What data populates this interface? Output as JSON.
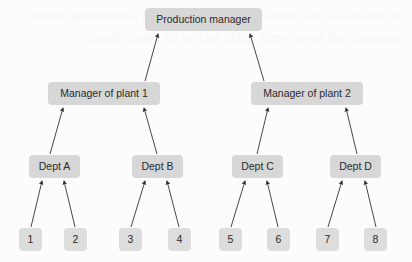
{
  "diagram": {
    "type": "organizational-hierarchy",
    "background_color": "#fcfcfc",
    "node_fill_color": "#d7d7d7",
    "leaf_fill_color": "#dddddd",
    "edge_color": "#333333",
    "text_color": "#2b2b2b",
    "edge_direction": "upward",
    "levels": 4,
    "bleed_text": "the structure of the organization and the reporting relationships among managers and departments within each of the plants shown"
  },
  "nodes": {
    "root": {
      "id": "production-manager",
      "label": "Production manager",
      "level": 1,
      "x": 145,
      "y": 8,
      "width": 117,
      "height": 23
    },
    "managers": [
      {
        "id": "manager-of-plant-1",
        "label": "Manager of plant 1",
        "level": 2,
        "x": 48,
        "y": 82,
        "width": 112,
        "height": 23
      },
      {
        "id": "manager-of-plant-2",
        "label": "Manager of plant 2",
        "level": 2,
        "x": 251,
        "y": 82,
        "width": 112,
        "height": 23
      }
    ],
    "departments": [
      {
        "id": "dept-a",
        "label": "Dept A",
        "level": 3,
        "x": 29,
        "y": 155,
        "width": 51,
        "height": 23
      },
      {
        "id": "dept-b",
        "label": "Dept B",
        "level": 3,
        "x": 132,
        "y": 155,
        "width": 51,
        "height": 23
      },
      {
        "id": "dept-c",
        "label": "Dept C",
        "level": 3,
        "x": 232,
        "y": 155,
        "width": 51,
        "height": 23
      },
      {
        "id": "dept-d",
        "label": "Dept D",
        "level": 3,
        "x": 330,
        "y": 155,
        "width": 51,
        "height": 23
      }
    ],
    "units": [
      {
        "id": "unit-1",
        "label": "1",
        "level": 4,
        "x": 19,
        "y": 228
      },
      {
        "id": "unit-2",
        "label": "2",
        "level": 4,
        "x": 64,
        "y": 228
      },
      {
        "id": "unit-3",
        "label": "3",
        "level": 4,
        "x": 119,
        "y": 228
      },
      {
        "id": "unit-4",
        "label": "4",
        "level": 4,
        "x": 168,
        "y": 228
      },
      {
        "id": "unit-5",
        "label": "5",
        "level": 4,
        "x": 219,
        "y": 228
      },
      {
        "id": "unit-6",
        "label": "6",
        "level": 4,
        "x": 267,
        "y": 228
      },
      {
        "id": "unit-7",
        "label": "7",
        "level": 4,
        "x": 316,
        "y": 228
      },
      {
        "id": "unit-8",
        "label": "8",
        "level": 4,
        "x": 364,
        "y": 228
      }
    ]
  },
  "edges": [
    {
      "id": "edge-plant1-to-production",
      "from": "manager-of-plant-1",
      "to": "production-manager",
      "x1": 145,
      "y1": 81,
      "x2": 158,
      "y2": 34
    },
    {
      "id": "edge-plant2-to-production",
      "from": "manager-of-plant-2",
      "to": "production-manager",
      "x1": 264,
      "y1": 81,
      "x2": 250,
      "y2": 34
    },
    {
      "id": "edge-depta-to-plant1",
      "from": "dept-a",
      "to": "manager-of-plant-1",
      "x1": 50,
      "y1": 154,
      "x2": 63,
      "y2": 108
    },
    {
      "id": "edge-deptb-to-plant1",
      "from": "dept-b",
      "to": "manager-of-plant-1",
      "x1": 157,
      "y1": 154,
      "x2": 144,
      "y2": 108
    },
    {
      "id": "edge-deptc-to-plant2",
      "from": "dept-c",
      "to": "manager-of-plant-2",
      "x1": 257,
      "y1": 154,
      "x2": 268,
      "y2": 108
    },
    {
      "id": "edge-deptd-to-plant2",
      "from": "dept-d",
      "to": "manager-of-plant-2",
      "x1": 357,
      "y1": 154,
      "x2": 346,
      "y2": 108
    },
    {
      "id": "edge-unit1-to-depta",
      "from": "unit-1",
      "to": "dept-a",
      "x1": 31,
      "y1": 227,
      "x2": 42,
      "y2": 181
    },
    {
      "id": "edge-unit2-to-depta",
      "from": "unit-2",
      "to": "dept-a",
      "x1": 75,
      "y1": 227,
      "x2": 64,
      "y2": 181
    },
    {
      "id": "edge-unit3-to-deptb",
      "from": "unit-3",
      "to": "dept-b",
      "x1": 131,
      "y1": 227,
      "x2": 145,
      "y2": 181
    },
    {
      "id": "edge-unit4-to-deptb",
      "from": "unit-4",
      "to": "dept-b",
      "x1": 179,
      "y1": 227,
      "x2": 167,
      "y2": 181
    },
    {
      "id": "edge-unit5-to-deptc",
      "from": "unit-5",
      "to": "dept-c",
      "x1": 231,
      "y1": 227,
      "x2": 245,
      "y2": 181
    },
    {
      "id": "edge-unit6-to-deptc",
      "from": "unit-6",
      "to": "dept-c",
      "x1": 278,
      "y1": 227,
      "x2": 267,
      "y2": 181
    },
    {
      "id": "edge-unit7-to-deptd",
      "from": "unit-7",
      "to": "dept-d",
      "x1": 328,
      "y1": 227,
      "x2": 342,
      "y2": 181
    },
    {
      "id": "edge-unit8-to-deptd",
      "from": "unit-8",
      "to": "dept-d",
      "x1": 376,
      "y1": 227,
      "x2": 365,
      "y2": 181
    }
  ]
}
